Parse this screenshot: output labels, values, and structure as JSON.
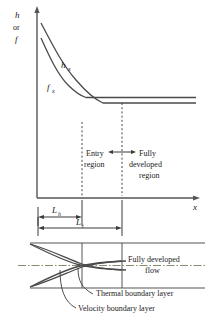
{
  "figure": {
    "type": "diagram",
    "axes": {
      "y_label_line1": "h",
      "y_label_line2": "or",
      "y_label_line3": "f",
      "x_label": "x"
    },
    "curves": [
      {
        "name": "heat-transfer-coefficient",
        "label_base": "h",
        "label_sub": "x"
      },
      {
        "name": "friction-factor",
        "label_base": "f",
        "label_sub": "x"
      }
    ],
    "regions": [
      {
        "name": "entry-region",
        "line1": "Entry",
        "line2": "region"
      },
      {
        "name": "fully-developed-region",
        "line1": "Fully",
        "line2": "developed",
        "line3": "region"
      }
    ],
    "dimensions": [
      {
        "name": "hydrodynamic-entry-length",
        "base": "L",
        "sub": "h"
      },
      {
        "name": "thermal-entry-length",
        "base": "L",
        "sub": "t"
      }
    ],
    "annotations": [
      {
        "name": "fully-developed-flow",
        "line1": "Fully developed",
        "line2": "flow"
      },
      {
        "name": "thermal-boundary-layer",
        "text": "Thermal boundary layer"
      },
      {
        "name": "velocity-boundary-layer",
        "text": "Velocity boundary layer"
      }
    ],
    "colors": {
      "ink": "#1a1a1a",
      "axis": "#555555",
      "curve": "#4a4a4a",
      "dash": "#444444",
      "centerline": "#8a8a6a",
      "background": "#ffffff"
    }
  }
}
